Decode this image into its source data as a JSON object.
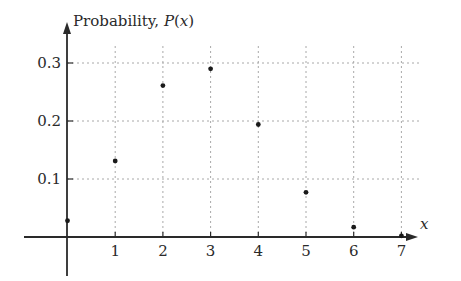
{
  "chart_data": {
    "type": "scatter",
    "title": "",
    "xlabel": "x",
    "ylabel": "Probability, P(x)",
    "ylabel_parts": {
      "prefix": "Probability, ",
      "italic_p": "P",
      "open": "(",
      "italic_x": "x",
      "close": ")"
    },
    "x": [
      0,
      1,
      2,
      3,
      4,
      5,
      6,
      7
    ],
    "values": [
      0.028,
      0.131,
      0.261,
      0.29,
      0.194,
      0.077,
      0.017,
      0.002
    ],
    "x_ticks": [
      "1",
      "2",
      "3",
      "4",
      "5",
      "6",
      "7"
    ],
    "y_ticks": [
      "0.1",
      "0.2",
      "0.3"
    ],
    "xlim": [
      -1,
      7.5
    ],
    "ylim": [
      -0.07,
      0.33
    ],
    "grid": true,
    "grid_style": "dotted",
    "legend": null
  },
  "colors": {
    "axis": "#2a2a2a",
    "grid": "#a8a8a8",
    "point": "#1a1a1a",
    "background": "#ffffff"
  }
}
